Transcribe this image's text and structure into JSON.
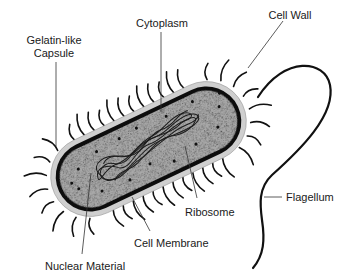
{
  "diagram": {
    "labels": {
      "capsule": [
        "Gelatin-like",
        "Capsule"
      ],
      "cytoplasm": "Cytoplasm",
      "cell_wall": "Cell Wall",
      "flagellum": "Flagellum",
      "ribosome": "Ribosome",
      "cell_membrane": "Cell Membrane",
      "nuclear_material": "Nuclear Material"
    },
    "colors": {
      "cytoplasm": "#a9a9a9",
      "capsule": "#cfcfcf",
      "wall": "#0d0d0d",
      "background": "#ffffff"
    }
  }
}
